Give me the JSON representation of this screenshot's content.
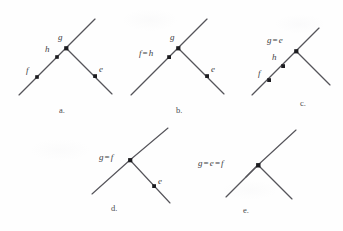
{
  "figure": {
    "background_color": "#fefefe",
    "line_color": "#55545a",
    "node_color": "#1c1c20",
    "label_color": "#3d3d42"
  },
  "panels": [
    {
      "id": "a",
      "caption": "a.",
      "labels": [
        {
          "name": "label-g",
          "text": "g"
        },
        {
          "name": "label-h",
          "text": "h"
        },
        {
          "name": "label-f",
          "text": "f"
        },
        {
          "name": "label-e",
          "text": "e"
        }
      ]
    },
    {
      "id": "b",
      "caption": "b.",
      "labels": [
        {
          "name": "label-g",
          "text": "g"
        },
        {
          "name": "label-f-eq-h",
          "lhs": "f",
          "eq": "=",
          "rhs": "h"
        },
        {
          "name": "label-e",
          "text": "e"
        }
      ]
    },
    {
      "id": "c",
      "caption": "c.",
      "labels": [
        {
          "name": "label-g-eq-e",
          "lhs": "g",
          "eq": "=",
          "rhs": "e"
        },
        {
          "name": "label-h",
          "text": "h"
        },
        {
          "name": "label-f",
          "text": "f"
        }
      ]
    },
    {
      "id": "d",
      "caption": "d.",
      "labels": [
        {
          "name": "label-g-eq-f",
          "lhs": "g",
          "eq": "=",
          "rhs": "f"
        },
        {
          "name": "label-e",
          "text": "e"
        }
      ]
    },
    {
      "id": "e",
      "caption": "e.",
      "labels": [
        {
          "name": "label-g-eq-e-eq-f",
          "lhs": "g",
          "eq1": "=",
          "mid": "e",
          "eq2": "=",
          "rhs": "f"
        }
      ]
    }
  ],
  "text": {
    "panel_a": {
      "g": "g",
      "h": "h",
      "f": "f",
      "e": "e",
      "caption": "a."
    },
    "panel_b": {
      "g": "g",
      "f": "f",
      "eq": "=",
      "h": "h",
      "e": "e",
      "caption": "b."
    },
    "panel_c": {
      "g": "g",
      "eq": "=",
      "e": "e",
      "h": "h",
      "f": "f",
      "caption": "c."
    },
    "panel_d": {
      "g": "g",
      "eq": "=",
      "f": "f",
      "e": "e",
      "caption": "d."
    },
    "panel_e": {
      "g": "g",
      "eq1": "=",
      "e": "e",
      "eq2": "=",
      "f": "f",
      "caption": "e."
    }
  }
}
